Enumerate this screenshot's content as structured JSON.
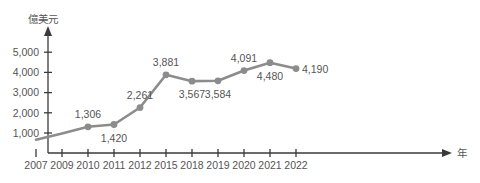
{
  "chart_data": {
    "type": "line",
    "title": "",
    "xlabel": "年",
    "ylabel": "億美元",
    "grid": false,
    "legend": "none",
    "ylim": [
      0,
      5600
    ],
    "yticks": [
      1000,
      2000,
      3000,
      4000,
      5000
    ],
    "ytick_labels": [
      "1,000",
      "2,000",
      "3,000",
      "4,000",
      "5,000"
    ],
    "categories": [
      "2007",
      "2009",
      "2010",
      "2011",
      "2012",
      "2015",
      "2018",
      "2019",
      "2020",
      "2021",
      "2022"
    ],
    "series": [
      {
        "name": "",
        "color": "#8c8c8c",
        "values": [
          670,
          980,
          1306,
          1420,
          2261,
          3881,
          3567,
          3584,
          4091,
          4480,
          4190
        ]
      }
    ],
    "point_labels": [
      {
        "category": "2007",
        "value": 670,
        "text": "",
        "show": false,
        "position": "none"
      },
      {
        "category": "2009",
        "value": 980,
        "text": "",
        "show": false,
        "position": "none"
      },
      {
        "category": "2010",
        "value": 1306,
        "text": "1,306",
        "show": true,
        "position": "above"
      },
      {
        "category": "2011",
        "value": 1420,
        "text": "1,420",
        "show": true,
        "position": "below"
      },
      {
        "category": "2012",
        "value": 2261,
        "text": "2,261",
        "show": true,
        "position": "above"
      },
      {
        "category": "2015",
        "value": 3881,
        "text": "3,881",
        "show": true,
        "position": "above"
      },
      {
        "category": "2018",
        "value": 3567,
        "text": "3,567",
        "show": true,
        "position": "below"
      },
      {
        "category": "2019",
        "value": 3584,
        "text": "3,584",
        "show": true,
        "position": "below"
      },
      {
        "category": "2020",
        "value": 4091,
        "text": "4,091",
        "show": true,
        "position": "above"
      },
      {
        "category": "2021",
        "value": 4480,
        "text": "4,480",
        "show": true,
        "position": "below"
      },
      {
        "category": "2022",
        "value": 4190,
        "text": "4,190",
        "show": true,
        "position": "right"
      }
    ],
    "markers": {
      "shown_for": [
        "2010",
        "2011",
        "2012",
        "2015",
        "2018",
        "2019",
        "2020",
        "2021",
        "2022"
      ],
      "shape": "circle",
      "color": "#8c8c8c"
    }
  },
  "axes": {
    "y_axis_title": "億美元",
    "x_axis_title": "年",
    "axis_color": "#3a3a3a",
    "tick_label_color": "#555555"
  },
  "header": {
    "faint_text": ""
  }
}
